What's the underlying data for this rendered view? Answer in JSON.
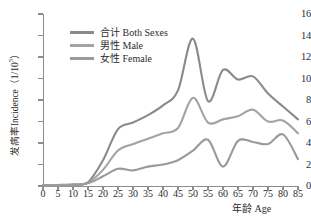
{
  "chart_data": {
    "type": "line",
    "title": "",
    "xlabel": "年龄 Age",
    "ylabel_cn": "发病率",
    "ylabel_en": "Incidence",
    "ylabel_unit": "（1/10",
    "ylabel_unit_sup": "5",
    "ylabel_unit_close": "）",
    "xlim": [
      0,
      85
    ],
    "ylim": [
      0,
      16
    ],
    "xticks": [
      0,
      5,
      10,
      15,
      20,
      25,
      30,
      35,
      40,
      45,
      50,
      55,
      60,
      65,
      70,
      75,
      80,
      85
    ],
    "yticks": [
      0,
      2,
      4,
      6,
      8,
      10,
      12,
      14,
      16
    ],
    "grid": false,
    "legend_position": "upper-left-inside",
    "x": [
      0,
      5,
      10,
      15,
      20,
      25,
      30,
      35,
      40,
      45,
      50,
      55,
      60,
      65,
      70,
      75,
      80,
      85
    ],
    "series": [
      {
        "name": "合计 Both Sexes",
        "color": "#8a8a8a",
        "values": [
          0.1,
          0.1,
          0.15,
          0.35,
          2.4,
          5.3,
          5.9,
          6.6,
          7.5,
          8.9,
          13.7,
          7.9,
          10.8,
          9.9,
          10.2,
          8.6,
          7.4,
          6.2
        ]
      },
      {
        "name": "男性 Male",
        "color": "#a3a3a3",
        "values": [
          0.08,
          0.08,
          0.12,
          0.3,
          1.5,
          3.3,
          3.9,
          4.4,
          4.9,
          5.4,
          8.2,
          5.9,
          6.2,
          6.5,
          7.1,
          6.0,
          6.1,
          4.9
        ]
      },
      {
        "name": "女性 Female",
        "color": "#9a9a9a",
        "values": [
          0.05,
          0.05,
          0.08,
          0.25,
          0.9,
          1.6,
          1.45,
          1.8,
          2.0,
          2.4,
          3.3,
          4.3,
          1.8,
          4.2,
          4.1,
          3.9,
          4.8,
          2.5
        ]
      }
    ],
    "annotations": []
  },
  "axis": {
    "y_tick_labels": [
      "0",
      "2",
      "4",
      "6",
      "8",
      "10",
      "12",
      "14",
      "16"
    ],
    "x_tick_labels": [
      "0",
      "5",
      "10",
      "15",
      "20",
      "25",
      "30",
      "35",
      "40",
      "45",
      "50",
      "55",
      "60",
      "65",
      "70",
      "75",
      "80",
      "85"
    ],
    "x_title": "年龄 Age"
  },
  "legend": {
    "items": [
      {
        "label": "合计 Both Sexes",
        "color": "#8a8a8a"
      },
      {
        "label": "男性 Male",
        "color": "#a3a3a3"
      },
      {
        "label": "女性 Female",
        "color": "#9a9a9a"
      }
    ]
  },
  "colors": {
    "axis": "#8c8c8c",
    "text": "#2b2b2b",
    "background": "#ffffff"
  }
}
